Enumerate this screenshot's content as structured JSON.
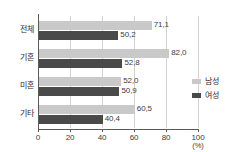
{
  "chart_data": {
    "type": "bar",
    "orientation": "horizontal",
    "title": "",
    "xlabel": "(%)",
    "ylabel": "",
    "xlim": [
      0,
      100
    ],
    "xticks": [
      "0",
      "20",
      "40",
      "60",
      "80",
      "100"
    ],
    "xtick_values": [
      0,
      20,
      40,
      60,
      80,
      100
    ],
    "grid": true,
    "grid_axis": "x",
    "legend_position": "right",
    "decimal_separator": ",",
    "categories": [
      "전체",
      "기혼",
      "미혼",
      "기타"
    ],
    "series": [
      {
        "name": "남성",
        "color": "#c9c9c9",
        "values": [
          71.1,
          82.0,
          52.0,
          60.5
        ],
        "labels": [
          "71,1",
          "82,0",
          "52,0",
          "60,5"
        ]
      },
      {
        "name": "여성",
        "color": "#4a4a4a",
        "values": [
          50.2,
          52.8,
          50.9,
          40.4
        ],
        "labels": [
          "50,2",
          "52,8",
          "50,9",
          "40,4"
        ]
      }
    ]
  },
  "legend": {
    "items": [
      {
        "label": "남성",
        "color": "#c9c9c9"
      },
      {
        "label": "여성",
        "color": "#4a4a4a"
      }
    ]
  },
  "axis": {
    "unit": "(%)"
  }
}
